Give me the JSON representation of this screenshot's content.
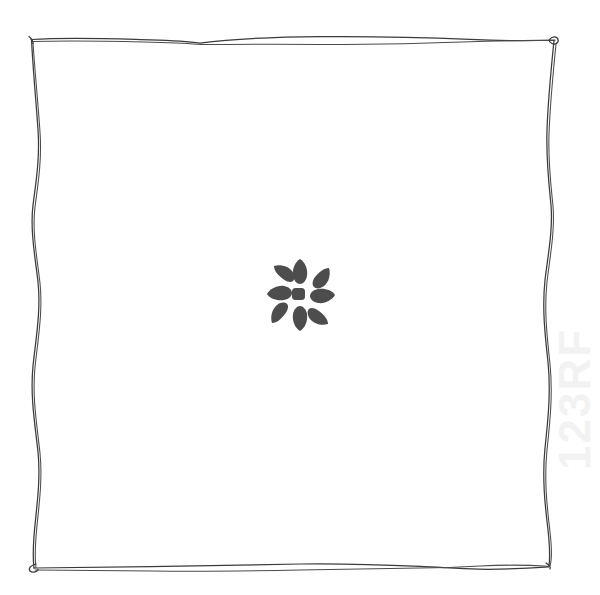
{
  "page": {
    "title": "Hand-drawn frame with flower glyph",
    "width": 600,
    "height": 595,
    "background_color": "#ffffff"
  },
  "colors": {
    "background": "#ffffff",
    "ink": "#3a3a3a",
    "ink_light": "#4a4a4a",
    "glyph_fill": "#4d4d4d",
    "watermark": "#f2f2f2"
  },
  "frame": {
    "name": "hand-drawn-border-frame",
    "style": "double wavy pen stroke",
    "stroke_color": "#3a3a3a",
    "stroke_width": 1.25,
    "bounds": {
      "left": 31,
      "top": 38,
      "right": 556,
      "bottom": 568
    },
    "corners": [
      {
        "name": "top-left",
        "x": 31,
        "y": 39,
        "detail": "sharp pen start tick"
      },
      {
        "name": "top-right",
        "x": 555,
        "y": 39,
        "detail": "small hook curl"
      },
      {
        "name": "bottom-left",
        "x": 34,
        "y": 567,
        "detail": "small loop"
      },
      {
        "name": "bottom-right",
        "x": 549,
        "y": 566,
        "detail": "blunt pen end"
      }
    ],
    "edges": [
      {
        "name": "top-edge",
        "orientation": "horizontal",
        "strokes": 2
      },
      {
        "name": "right-edge",
        "orientation": "vertical",
        "strokes": 2
      },
      {
        "name": "bottom-edge",
        "orientation": "horizontal",
        "strokes": 2
      },
      {
        "name": "left-edge",
        "orientation": "vertical",
        "strokes": 2
      }
    ]
  },
  "glyph": {
    "name": "flower-asterisk-glyph",
    "kind": "eight-petal flower",
    "center": {
      "x": 300,
      "y": 295
    },
    "bounds": {
      "left": 267,
      "top": 259,
      "right": 335,
      "bottom": 331
    },
    "petal_count": 8,
    "fill": "#4d4d4d",
    "center_dot": {
      "name": "glyph-center-dot",
      "x": 298,
      "y": 294,
      "width": 13,
      "height": 12,
      "shape": "rounded square"
    },
    "petals": [
      {
        "index": 0,
        "angle_deg": 270,
        "label": "top-petal"
      },
      {
        "index": 1,
        "angle_deg": 315,
        "label": "top-right-petal"
      },
      {
        "index": 2,
        "angle_deg": 0,
        "label": "right-petal"
      },
      {
        "index": 3,
        "angle_deg": 45,
        "label": "bottom-right-petal"
      },
      {
        "index": 4,
        "angle_deg": 90,
        "label": "bottom-petal"
      },
      {
        "index": 5,
        "angle_deg": 135,
        "label": "bottom-left-petal"
      },
      {
        "index": 6,
        "angle_deg": 180,
        "label": "left-petal"
      },
      {
        "index": 7,
        "angle_deg": 225,
        "label": "top-left-petal"
      }
    ]
  },
  "watermark": {
    "name": "edge-watermark",
    "visible": true,
    "opacity": "very faint",
    "color": "#f2f2f2",
    "position": "right edge, vertical",
    "text": "123RF"
  }
}
